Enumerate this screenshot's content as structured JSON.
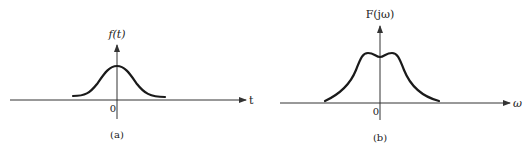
{
  "panels": [
    {
      "id": "a",
      "caption": "(a)",
      "y_label": "f(t)",
      "x_label": "t",
      "origin_label": "0",
      "curve": "Gaussian-like pulse centered at t=0"
    },
    {
      "id": "b",
      "caption": "(b)",
      "y_label": "F(jω)",
      "x_label": "ω",
      "origin_label": "0",
      "curve": "Double-humped spectrum with slight dip at ω=0"
    }
  ],
  "colors": {
    "stroke": "#1a1a1a",
    "axis": "#333333",
    "background": "#ffffff"
  }
}
